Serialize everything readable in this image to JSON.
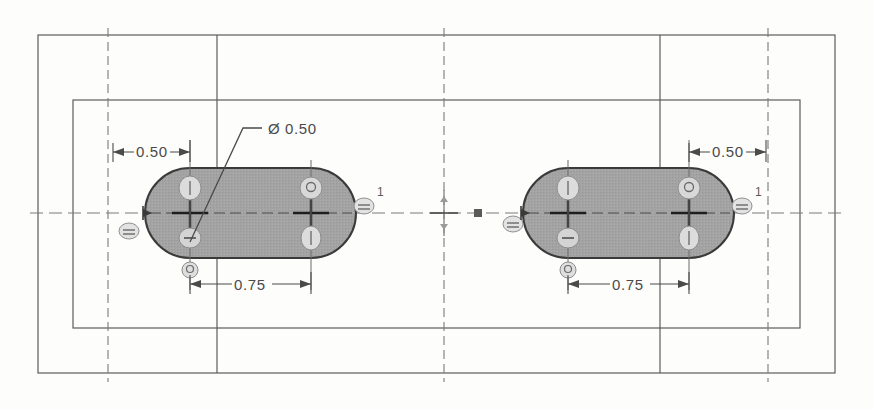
{
  "drawing": {
    "title": "Slot feature drawing",
    "units": "inches",
    "background_color": "#fdfdfc",
    "line_color": "#5d5d5d",
    "slot_fill_color": "#a0a0a0",
    "slot_edge_color": "#3a3a3a",
    "centerline_color": "#6b6b6b",
    "dimension_color": "#4a4a4a"
  },
  "frame": {
    "outer_rect": {
      "x": 38,
      "y": 35,
      "width": 797,
      "height": 338
    },
    "inner_rect": {
      "x": 73,
      "y": 100,
      "width": 727,
      "height": 228
    },
    "vertical_dividers": [
      {
        "x": 217,
        "label": "divider-left"
      },
      {
        "x": 660,
        "label": "divider-right"
      }
    ],
    "vertical_centerlines": [
      {
        "x": 108,
        "label": "centerline-left"
      },
      {
        "x": 444,
        "label": "centerline-middle"
      },
      {
        "x": 768,
        "label": "centerline-right"
      }
    ],
    "horizontal_centerline": {
      "y": 213
    }
  },
  "slots": [
    {
      "name": "slot-left",
      "center_y": 213,
      "hole_left_x": 190,
      "hole_right_x": 311,
      "radius": 45,
      "dimensions": {
        "offset": "0.50",
        "pitch": "0.75",
        "diameter": "Ø 0.50"
      },
      "balloons": [
        {
          "name": "balloon-left",
          "label": "",
          "x": 129,
          "y": 231
        },
        {
          "name": "balloon-right",
          "label": "1",
          "x": 364,
          "y": 202
        },
        {
          "name": "balloon-bottom",
          "label": "",
          "x": 190,
          "y": 270
        }
      ],
      "relation_markers": [
        {
          "name": "relation-upper-left",
          "x": 190,
          "y": 188
        },
        {
          "name": "relation-lower-left",
          "x": 190,
          "y": 238
        },
        {
          "name": "relation-upper-right",
          "x": 311,
          "y": 188
        },
        {
          "name": "relation-lower-right",
          "x": 311,
          "y": 238
        }
      ]
    },
    {
      "name": "slot-right",
      "center_y": 213,
      "hole_left_x": 568,
      "hole_right_x": 689,
      "radius": 45,
      "dimensions": {
        "offset": "0.50",
        "pitch": "0.75",
        "diameter": ""
      },
      "balloons": [
        {
          "name": "balloon-left",
          "label": "",
          "x": 513,
          "y": 226
        },
        {
          "name": "balloon-right",
          "label": "1",
          "x": 742,
          "y": 202
        },
        {
          "name": "balloon-bottom",
          "label": "",
          "x": 568,
          "y": 270
        }
      ],
      "relation_markers": [
        {
          "name": "relation-upper-left",
          "x": 568,
          "y": 188
        },
        {
          "name": "relation-lower-left",
          "x": 568,
          "y": 238
        },
        {
          "name": "relation-upper-right",
          "x": 689,
          "y": 188
        },
        {
          "name": "relation-lower-right",
          "x": 689,
          "y": 238
        }
      ]
    }
  ],
  "annotations": {
    "diameter_callout": {
      "text": "Ø 0.50",
      "text_x": 268,
      "text_y": 135,
      "leader_from_x": 190,
      "leader_from_y": 240,
      "leader_to_x": 243,
      "leader_to_y": 128
    },
    "left_offset_dim": {
      "text": "0.50",
      "text_x": 148,
      "text_y": 157,
      "line_y": 152,
      "from_x": 113,
      "to_x": 190
    },
    "left_pitch_dim": {
      "text": "0.75",
      "text_x": 250,
      "text_y": 290,
      "line_y": 284,
      "from_x": 190,
      "to_x": 311
    },
    "right_offset_dim": {
      "text": "0.50",
      "text_x": 728,
      "text_y": 157,
      "line_y": 152,
      "from_x": 689,
      "to_x": 766
    },
    "right_pitch_dim": {
      "text": "0.75",
      "text_x": 628,
      "text_y": 290,
      "line_y": 284,
      "from_x": 568,
      "to_x": 689
    },
    "origin_marker": {
      "x": 444,
      "y": 213,
      "name": "sketch-origin"
    },
    "midpoint_marker": {
      "x": 478,
      "y": 213,
      "name": "midpoint-marker"
    }
  }
}
